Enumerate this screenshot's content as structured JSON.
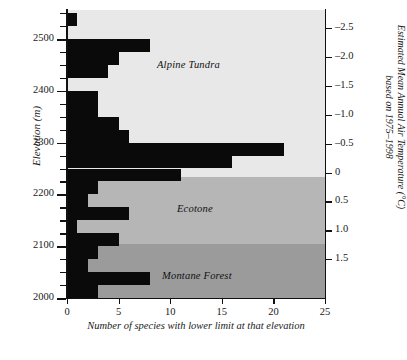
{
  "chart_data": {
    "type": "bar",
    "orientation": "horizontal",
    "title": "",
    "xlabel": "Number of species with lower limit at that elevation",
    "ylabel": "Elevation (m)",
    "y2label": "Estimated Mean Annual Air Temperature (°C) based on 1975–1998",
    "xlim": [
      0,
      25
    ],
    "ylim": [
      2000,
      2556
    ],
    "xticks": [
      0,
      5,
      10,
      15,
      20,
      25
    ],
    "xticklabels": [
      "0",
      "5",
      "10",
      "15",
      "20",
      "25"
    ],
    "yticks": [
      2000,
      2100,
      2200,
      2300,
      2400,
      2500
    ],
    "yticklabels": [
      "2000",
      "2100",
      "2200",
      "2300",
      "2400",
      "2500"
    ],
    "y_minor_tick_interval": 25,
    "y2_ticks": [
      -2.5,
      -2.0,
      -1.5,
      -1.0,
      -0.5,
      0,
      0.5,
      1.0,
      1.5
    ],
    "y2_ticklabels": [
      "–2.5",
      "–2.0",
      "–1.5",
      "–1.0",
      "–0.5",
      "0",
      "0.5",
      "1.0",
      "1.5"
    ],
    "grid": false,
    "legend": "none",
    "bar_color": "#0a0a0a",
    "bin_width_m": 25,
    "bins": [
      {
        "elev_low": 2525,
        "elev_high": 2550,
        "value": 1
      },
      {
        "elev_low": 2500,
        "elev_high": 2525,
        "value": 0
      },
      {
        "elev_low": 2475,
        "elev_high": 2500,
        "value": 8
      },
      {
        "elev_low": 2450,
        "elev_high": 2475,
        "value": 5
      },
      {
        "elev_low": 2425,
        "elev_high": 2450,
        "value": 4
      },
      {
        "elev_low": 2400,
        "elev_high": 2425,
        "value": 0
      },
      {
        "elev_low": 2375,
        "elev_high": 2400,
        "value": 3
      },
      {
        "elev_low": 2350,
        "elev_high": 2375,
        "value": 3
      },
      {
        "elev_low": 2325,
        "elev_high": 2350,
        "value": 5
      },
      {
        "elev_low": 2300,
        "elev_high": 2325,
        "value": 6
      },
      {
        "elev_low": 2275,
        "elev_high": 2300,
        "value": 21
      },
      {
        "elev_low": 2250,
        "elev_high": 2275,
        "value": 16
      },
      {
        "elev_low": 2225,
        "elev_high": 2250,
        "value": 11
      },
      {
        "elev_low": 2200,
        "elev_high": 2225,
        "value": 3
      },
      {
        "elev_low": 2175,
        "elev_high": 2200,
        "value": 2
      },
      {
        "elev_low": 2150,
        "elev_high": 2175,
        "value": 6
      },
      {
        "elev_low": 2125,
        "elev_high": 2150,
        "value": 1
      },
      {
        "elev_low": 2100,
        "elev_high": 2125,
        "value": 5
      },
      {
        "elev_low": 2075,
        "elev_high": 2100,
        "value": 3
      },
      {
        "elev_low": 2050,
        "elev_high": 2075,
        "value": 2
      },
      {
        "elev_low": 2025,
        "elev_high": 2050,
        "value": 8
      },
      {
        "elev_low": 2000,
        "elev_high": 2025,
        "value": 3
      }
    ],
    "zones": [
      {
        "name": "Alpine Tundra",
        "elev_low": 2233,
        "elev_high": 2556,
        "color": "#e8e8e8"
      },
      {
        "name": "Ecotone",
        "elev_low": 2105,
        "elev_high": 2233,
        "color": "#b6b6b6"
      },
      {
        "name": "Montane Forest",
        "elev_low": 2000,
        "elev_high": 2105,
        "color": "#9b9b9b"
      }
    ]
  }
}
